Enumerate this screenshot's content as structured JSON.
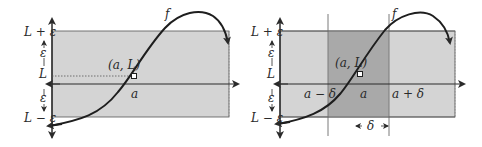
{
  "figure": {
    "left_panel": {
      "curve_label": "f",
      "point_label": "(a, L)",
      "x_label": "a",
      "y_labels": {
        "upper": "L + ε",
        "epsilon_top": "ε",
        "center": "L",
        "epsilon_bottom": "ε",
        "lower": "L − ε"
      }
    },
    "right_panel": {
      "curve_label": "f",
      "point_label": "(a, L)",
      "x_labels": {
        "left": "a − δ",
        "center": "a",
        "right": "a + δ"
      },
      "delta_label": "δ",
      "y_labels": {
        "upper": "L + ε",
        "epsilon_top": "ε",
        "center": "L",
        "epsilon_bottom": "ε",
        "lower": "L − ε"
      }
    },
    "colors": {
      "band_fill": "#d4d4d4",
      "strip_fill": "#a9a9a9",
      "line": "#2a2a2a",
      "guide": "#7a7a7a"
    }
  }
}
